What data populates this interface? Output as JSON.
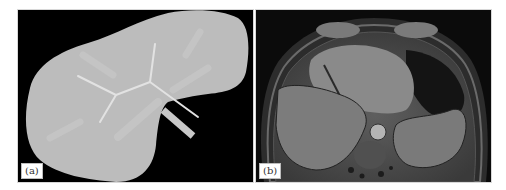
{
  "figure": {
    "panels": [
      {
        "id": "a",
        "label": "(a)",
        "content": "Synthetic liver phantom with vessel tree",
        "colors": {
          "background": "#000000",
          "organ": "#bcbcbc",
          "vessel_bright": "#e2e2e2",
          "vessel_dim": "#c6c6c6",
          "vessel_inlet": "#c8c8c8"
        }
      },
      {
        "id": "b",
        "label": "(b)",
        "content": "Axial MR image of the upper abdomen",
        "colors": {
          "background": "#0b0b0b",
          "tissue": "#6e6e6e",
          "liver": "#7a7a7a",
          "aorta": "#b4b4b4"
        }
      }
    ]
  }
}
